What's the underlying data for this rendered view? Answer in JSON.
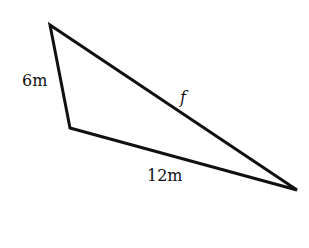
{
  "diagram": {
    "type": "triangle",
    "stroke_color": "#111111",
    "background": "#ffffff",
    "vertices": {
      "top": [
        50,
        25
      ],
      "bottom_left": [
        70,
        128
      ],
      "right": [
        297,
        190
      ]
    },
    "sides": [
      {
        "id": "left",
        "label": "6m",
        "from": "top",
        "to": "bottom_left"
      },
      {
        "id": "bottom",
        "label": "12m",
        "from": "bottom_left",
        "to": "right"
      },
      {
        "id": "hypotenuse",
        "label": "f",
        "from": "top",
        "to": "right"
      }
    ]
  },
  "labels": {
    "left_side": "6m",
    "top_side": "f",
    "bottom_side": "12m"
  }
}
